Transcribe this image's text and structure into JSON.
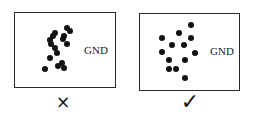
{
  "panels": [
    {
      "id": "incorrect",
      "label": "GND",
      "verdict": "×",
      "box": {
        "x": 14,
        "y": 12,
        "w": 102,
        "h": 76
      },
      "label_pos": {
        "x": 84,
        "y": 44
      },
      "verdict_pos": {
        "x": 63,
        "y": 102
      },
      "dots": [
        [
          67,
          28
        ],
        [
          70,
          31
        ],
        [
          55,
          33
        ],
        [
          64,
          36
        ],
        [
          53,
          36
        ],
        [
          50,
          40
        ],
        [
          63,
          39
        ],
        [
          67,
          44
        ],
        [
          51,
          44
        ],
        [
          55,
          48
        ],
        [
          57,
          53
        ],
        [
          50,
          58
        ],
        [
          62,
          63
        ],
        [
          58,
          66
        ],
        [
          64,
          68
        ],
        [
          45,
          69
        ]
      ]
    },
    {
      "id": "correct",
      "label": "GND",
      "verdict": "✓",
      "box": {
        "x": 139,
        "y": 13,
        "w": 101,
        "h": 78
      },
      "label_pos": {
        "x": 210,
        "y": 45
      },
      "verdict_pos": {
        "x": 190,
        "y": 101
      },
      "dots": [
        [
          191,
          25
        ],
        [
          179,
          33
        ],
        [
          162,
          38
        ],
        [
          191,
          38
        ],
        [
          172,
          45
        ],
        [
          184,
          45
        ],
        [
          162,
          52
        ],
        [
          195,
          53
        ],
        [
          169,
          60
        ],
        [
          185,
          60
        ],
        [
          169,
          69
        ],
        [
          176,
          69
        ],
        [
          185,
          78
        ]
      ]
    }
  ]
}
